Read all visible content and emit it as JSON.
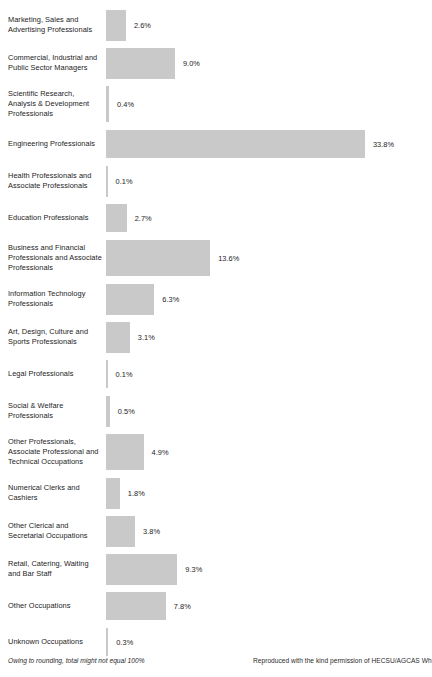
{
  "chart_data": {
    "type": "bar",
    "orientation": "horizontal",
    "title": "",
    "xlabel": "",
    "ylabel": "",
    "grid": false,
    "legend": false,
    "xlim": [
      0,
      33.8
    ],
    "value_suffix": "%",
    "bar_color": "#c9c9c9",
    "categories": [
      "Marketing, Sales and Advertising Professionals",
      "Commercial, Industrial and Public Sector Managers",
      "Scientific Research, Analysis & Development Professionals",
      "Engineering Professionals",
      "Health Professionals and Associate Professionals",
      "Education Professionals",
      "Business and Financial Professionals and Associate Professionals",
      "Information Technology Professionals",
      "Art, Design, Culture and Sports Professionals",
      "Legal Professionals",
      "Social & Welfare Professionals",
      "Other Professionals, Associate Professional and Technical Occupations",
      "Numerical Clerks and Cashiers",
      "Other Clerical and Secretarial Occupations",
      "Retail, Catering, Waiting and Bar Staff",
      "Other Occupations",
      "Unknown Occupations"
    ],
    "values": [
      2.6,
      9.0,
      0.4,
      33.8,
      0.1,
      2.7,
      13.6,
      6.3,
      3.1,
      0.1,
      0.5,
      4.9,
      1.8,
      3.8,
      9.3,
      7.8,
      0.3
    ],
    "value_labels": [
      "2.6%",
      "9.0%",
      "0.4%",
      "33.8%",
      "0.1%",
      "2.7%",
      "13.6%",
      "6.3%",
      "3.1%",
      "0.1%",
      "0.5%",
      "4.9%",
      "1.8%",
      "3.8%",
      "9.3%",
      "7.8%",
      "0.3%"
    ]
  },
  "rows": [
    {
      "label": "Marketing, Sales and Advertising Professionals",
      "value": 2.6,
      "value_label": "2.6%",
      "lines": 2
    },
    {
      "label": "Commercial, Industrial and Public Sector Managers",
      "value": 9.0,
      "value_label": "9.0%",
      "lines": 2
    },
    {
      "label": "Scientific Research, Analysis & Development Professionals",
      "value": 0.4,
      "value_label": "0.4%",
      "lines": 3
    },
    {
      "label": "Engineering Professionals",
      "value": 33.8,
      "value_label": "33.8%",
      "lines": 1
    },
    {
      "label": "Health Professionals and Associate Professionals",
      "value": 0.1,
      "value_label": "0.1%",
      "lines": 2
    },
    {
      "label": "Education Professionals",
      "value": 2.7,
      "value_label": "2.7%",
      "lines": 1
    },
    {
      "label": "Business and Financial Professionals and Associate Professionals",
      "value": 13.6,
      "value_label": "13.6%",
      "lines": 3
    },
    {
      "label": "Information Technology Professionals",
      "value": 6.3,
      "value_label": "6.3%",
      "lines": 2
    },
    {
      "label": "Art, Design, Culture and Sports Professionals",
      "value": 3.1,
      "value_label": "3.1%",
      "lines": 2
    },
    {
      "label": "Legal Professionals",
      "value": 0.1,
      "value_label": "0.1%",
      "lines": 1
    },
    {
      "label": "Social & Welfare Professionals",
      "value": 0.5,
      "value_label": "0.5%",
      "lines": 2
    },
    {
      "label": "Other Professionals, Associate Professional and Technical Occupations",
      "value": 4.9,
      "value_label": "4.9%",
      "lines": 3
    },
    {
      "label": "Numerical Clerks and Cashiers",
      "value": 1.8,
      "value_label": "1.8%",
      "lines": 2
    },
    {
      "label": "Other Clerical and Secretarial Occupations",
      "value": 3.8,
      "value_label": "3.8%",
      "lines": 2
    },
    {
      "label": "Retail, Catering, Waiting and Bar Staff",
      "value": 9.3,
      "value_label": "9.3%",
      "lines": 2
    },
    {
      "label": "Other Occupations",
      "value": 7.8,
      "value_label": "7.8%",
      "lines": 1
    },
    {
      "label": "Unknown Occupations",
      "value": 0.3,
      "value_label": "0.3%",
      "lines": 1
    }
  ],
  "footer": {
    "note": "Owing to rounding, total might not equal 100%",
    "credit": "Reproduced with the kind permission of HECSU/AGCAS Wh"
  },
  "scale": {
    "px_per_percent": 7.66,
    "bar_origin_x": 114
  }
}
